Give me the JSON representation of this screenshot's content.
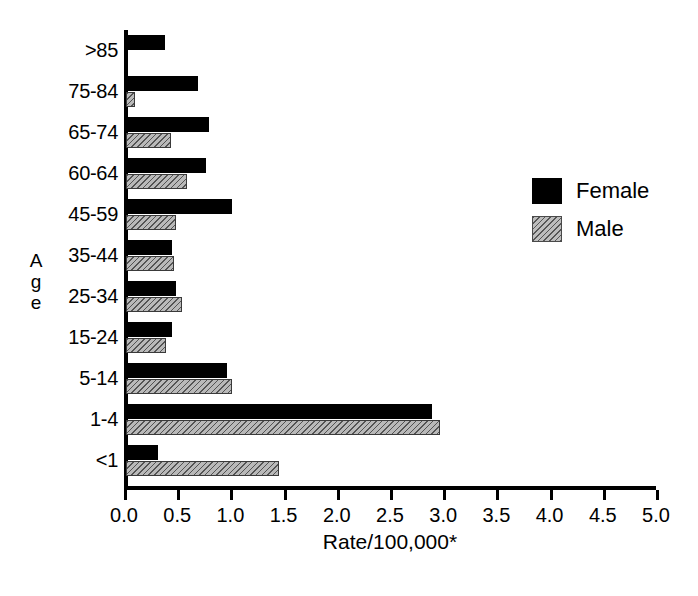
{
  "chart_data": {
    "type": "bar",
    "orientation": "horizontal",
    "title": "",
    "xlabel": "Rate/100,000*",
    "ylabel": "Age",
    "xlim": [
      0.0,
      5.0
    ],
    "grid": false,
    "legend_position": "right",
    "xticklabels": [
      "0.0",
      "0.5",
      "1.0",
      "1.5",
      "2.0",
      "2.5",
      "3.0",
      "3.5",
      "4.0",
      "4.5",
      "5.0"
    ],
    "xticks": [
      0.0,
      0.5,
      1.0,
      1.5,
      2.0,
      2.5,
      3.0,
      3.5,
      4.0,
      4.5,
      5.0
    ],
    "categories": [
      ">85",
      "75-84",
      "65-74",
      "60-64",
      "45-59",
      "35-44",
      "25-34",
      "15-24",
      "5-14",
      "1-4",
      "<1"
    ],
    "series": [
      {
        "name": "Female",
        "color": "#000000",
        "pattern": "solid",
        "values": [
          0.37,
          0.68,
          0.78,
          0.75,
          1.0,
          0.43,
          0.47,
          0.43,
          0.95,
          2.88,
          0.3
        ]
      },
      {
        "name": "Male",
        "color": "#bdbdbd",
        "pattern": "diagonal-hatch",
        "values": [
          0.0,
          0.08,
          0.42,
          0.57,
          0.47,
          0.45,
          0.53,
          0.38,
          1.0,
          2.95,
          1.44
        ]
      }
    ]
  },
  "axis_title_letters": [
    "A",
    "g",
    "e"
  ],
  "legend": {
    "items": [
      {
        "label": "Female",
        "swatch": "solid-black-swatch"
      },
      {
        "label": "Male",
        "swatch": "hatched-gray-swatch"
      }
    ]
  }
}
